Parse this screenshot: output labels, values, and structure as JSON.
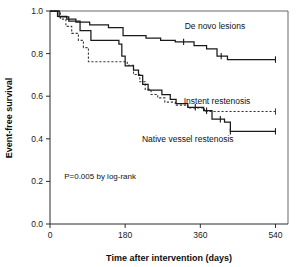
{
  "chart_data": {
    "type": "line",
    "title": "",
    "subtitle": "",
    "xlabel": "Time after intervention (days)",
    "ylabel": "Event-free survival",
    "xlim": [
      0,
      570
    ],
    "ylim": [
      0.0,
      1.0
    ],
    "grid": false,
    "legend_position": "inline-annotations",
    "xticks": [
      0,
      180,
      360,
      540
    ],
    "xtick_labels": [
      "0",
      "180",
      "360",
      "540"
    ],
    "yticks": [
      0.0,
      0.2,
      0.4,
      0.6,
      0.8,
      1.0
    ],
    "ytick_labels": [
      "0.0",
      "0.2",
      "0.4",
      "0.6",
      "0.8",
      "1.0"
    ],
    "annotations": [
      {
        "id": "pvalue",
        "text": "P=0.005 by log-rank",
        "x": 120,
        "y": 0.21
      },
      {
        "id": "de-novo-label",
        "text": "De novo lesions",
        "x": 395,
        "y": 0.915
      },
      {
        "id": "instent-label",
        "text": "Instent restenosis",
        "x": 400,
        "y": 0.565
      },
      {
        "id": "native-label",
        "text": "Native vessel restenosis",
        "x": 330,
        "y": 0.385
      }
    ],
    "series": [
      {
        "name": "De novo lesions",
        "style": "solid",
        "label_text": "De novo lesions",
        "points": [
          [
            0,
            1.0
          ],
          [
            18,
            1.0
          ],
          [
            18,
            0.975
          ],
          [
            40,
            0.975
          ],
          [
            40,
            0.962
          ],
          [
            62,
            0.962
          ],
          [
            62,
            0.948
          ],
          [
            95,
            0.948
          ],
          [
            95,
            0.935
          ],
          [
            140,
            0.935
          ],
          [
            140,
            0.922
          ],
          [
            175,
            0.922
          ],
          [
            175,
            0.885
          ],
          [
            230,
            0.885
          ],
          [
            230,
            0.873
          ],
          [
            265,
            0.873
          ],
          [
            265,
            0.862
          ],
          [
            300,
            0.862
          ],
          [
            300,
            0.855
          ],
          [
            345,
            0.855
          ],
          [
            345,
            0.838
          ],
          [
            375,
            0.838
          ],
          [
            375,
            0.822
          ],
          [
            400,
            0.822
          ],
          [
            400,
            0.788
          ],
          [
            425,
            0.788
          ],
          [
            425,
            0.772
          ],
          [
            540,
            0.772
          ]
        ],
        "censor_times": [
          320,
          410,
          540
        ]
      },
      {
        "name": "Instent restenosis",
        "style": "dotted",
        "label_text": "Instent restenosis",
        "points": [
          [
            0,
            1.0
          ],
          [
            25,
            1.0
          ],
          [
            25,
            0.962
          ],
          [
            38,
            0.962
          ],
          [
            38,
            0.928
          ],
          [
            52,
            0.928
          ],
          [
            52,
            0.895
          ],
          [
            68,
            0.895
          ],
          [
            68,
            0.862
          ],
          [
            80,
            0.862
          ],
          [
            80,
            0.828
          ],
          [
            92,
            0.828
          ],
          [
            92,
            0.762
          ],
          [
            185,
            0.762
          ],
          [
            185,
            0.745
          ],
          [
            200,
            0.745
          ],
          [
            200,
            0.702
          ],
          [
            215,
            0.702
          ],
          [
            215,
            0.668
          ],
          [
            228,
            0.668
          ],
          [
            228,
            0.632
          ],
          [
            242,
            0.632
          ],
          [
            242,
            0.608
          ],
          [
            258,
            0.608
          ],
          [
            258,
            0.592
          ],
          [
            275,
            0.592
          ],
          [
            275,
            0.572
          ],
          [
            300,
            0.572
          ],
          [
            300,
            0.558
          ],
          [
            330,
            0.558
          ],
          [
            330,
            0.545
          ],
          [
            370,
            0.545
          ],
          [
            370,
            0.528
          ],
          [
            540,
            0.528
          ]
        ],
        "censor_times": [
          540
        ]
      },
      {
        "name": "Native vessel restenosis",
        "style": "solid",
        "label_text": "Native vessel restenosis",
        "points": [
          [
            0,
            1.0
          ],
          [
            22,
            1.0
          ],
          [
            22,
            0.972
          ],
          [
            45,
            0.972
          ],
          [
            45,
            0.952
          ],
          [
            72,
            0.952
          ],
          [
            72,
            0.908
          ],
          [
            98,
            0.908
          ],
          [
            98,
            0.862
          ],
          [
            165,
            0.862
          ],
          [
            165,
            0.845
          ],
          [
            172,
            0.845
          ],
          [
            172,
            0.788
          ],
          [
            180,
            0.788
          ],
          [
            180,
            0.742
          ],
          [
            200,
            0.742
          ],
          [
            200,
            0.722
          ],
          [
            212,
            0.722
          ],
          [
            212,
            0.698
          ],
          [
            222,
            0.698
          ],
          [
            222,
            0.655
          ],
          [
            235,
            0.655
          ],
          [
            235,
            0.628
          ],
          [
            268,
            0.628
          ],
          [
            268,
            0.608
          ],
          [
            288,
            0.608
          ],
          [
            288,
            0.585
          ],
          [
            302,
            0.585
          ],
          [
            302,
            0.565
          ],
          [
            330,
            0.565
          ],
          [
            330,
            0.548
          ],
          [
            368,
            0.548
          ],
          [
            368,
            0.532
          ],
          [
            388,
            0.532
          ],
          [
            388,
            0.492
          ],
          [
            418,
            0.492
          ],
          [
            418,
            0.478
          ],
          [
            432,
            0.478
          ],
          [
            432,
            0.435
          ],
          [
            540,
            0.435
          ]
        ],
        "censor_times": [
          348,
          375,
          408,
          432,
          540
        ]
      }
    ]
  },
  "axes": {
    "x_title": "Time after intervention (days)",
    "y_title": "Event-free survival"
  },
  "colors": {
    "axis": "#2b2b2b",
    "curve": "#1a1a1a",
    "curve_dotted": "#3a3a3a",
    "background": "#ffffff"
  }
}
